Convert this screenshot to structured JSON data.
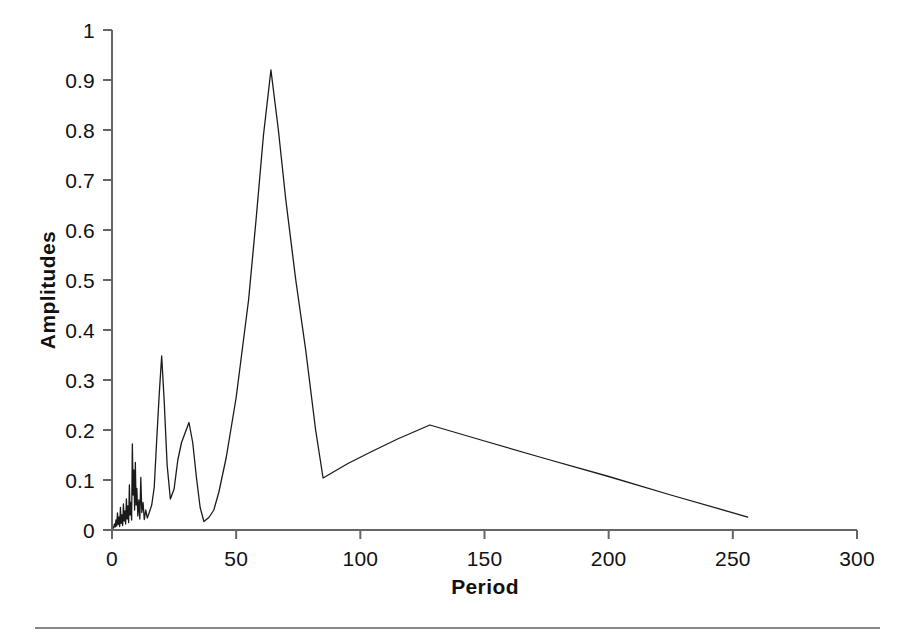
{
  "chart_data": {
    "type": "line",
    "title": "",
    "subtitle": "",
    "xlabel": "Period",
    "ylabel": "Amplitudes",
    "xlim": [
      0,
      300
    ],
    "ylim": [
      0,
      1
    ],
    "xticks": [
      0,
      50,
      100,
      150,
      200,
      250,
      300
    ],
    "xtick_labels": [
      "0",
      "50",
      "100",
      "150",
      "200",
      "250",
      "300"
    ],
    "yticks": [
      0,
      0.1,
      0.2,
      0.3,
      0.4,
      0.5,
      0.6,
      0.7,
      0.8,
      0.9,
      1
    ],
    "ytick_labels": [
      "0",
      "0.1",
      "0.2",
      "0.3",
      "0.4",
      "0.5",
      "0.6",
      "0.7",
      "0.8",
      "0.9",
      "1"
    ],
    "grid": false,
    "legend": false,
    "legend_position": "none",
    "line_color": "#1a1a1a",
    "line_width": 1.3,
    "series": [
      {
        "name": "Amplitudes",
        "x": [
          0.6,
          1.0,
          1.3,
          1.6,
          1.9,
          2.2,
          2.5,
          2.8,
          3.1,
          3.4,
          3.7,
          4.0,
          4.3,
          4.6,
          4.9,
          5.2,
          5.5,
          5.8,
          6.1,
          6.4,
          6.7,
          7.0,
          7.3,
          7.6,
          7.9,
          8.2,
          8.5,
          8.8,
          9.1,
          9.4,
          9.7,
          10.0,
          10.4,
          10.8,
          11.2,
          11.6,
          12.0,
          12.5,
          13.0,
          13.6,
          14.2,
          15.0,
          16.0,
          17.0,
          18.0,
          19.0,
          20.0,
          21.0,
          22.2,
          23.5,
          25.0,
          26.5,
          28.0,
          29.5,
          31.0,
          32.5,
          34.0,
          35.5,
          37.0,
          39.0,
          41.0,
          43.0,
          46.0,
          50.0,
          55.0,
          58.0,
          61.0,
          64.0,
          67.0,
          70.0,
          74.0,
          78.0,
          82.0,
          85.0,
          95.0,
          105.0,
          115.0,
          128.0,
          150.0,
          175.0,
          200.0,
          225.0,
          256.0
        ],
        "y": [
          0.004,
          0.012,
          0.006,
          0.02,
          0.008,
          0.034,
          0.011,
          0.026,
          0.007,
          0.045,
          0.013,
          0.03,
          0.009,
          0.052,
          0.018,
          0.038,
          0.012,
          0.062,
          0.022,
          0.048,
          0.015,
          0.09,
          0.03,
          0.055,
          0.02,
          0.172,
          0.07,
          0.12,
          0.04,
          0.135,
          0.05,
          0.083,
          0.028,
          0.06,
          0.022,
          0.105,
          0.035,
          0.055,
          0.021,
          0.04,
          0.024,
          0.035,
          0.05,
          0.085,
          0.18,
          0.27,
          0.348,
          0.26,
          0.13,
          0.062,
          0.082,
          0.14,
          0.175,
          0.195,
          0.215,
          0.175,
          0.105,
          0.045,
          0.017,
          0.025,
          0.04,
          0.075,
          0.145,
          0.265,
          0.46,
          0.62,
          0.79,
          0.92,
          0.8,
          0.66,
          0.5,
          0.36,
          0.2,
          0.104,
          0.133,
          0.158,
          0.182,
          0.21,
          0.178,
          0.142,
          0.107,
          0.07,
          0.026
        ]
      }
    ],
    "annotations": [
      {
        "label": "noise band",
        "period_range": [
          0,
          14
        ],
        "max_amplitude": 0.172
      },
      {
        "label": "secondary peak",
        "period": 20,
        "amplitude": 0.348
      },
      {
        "label": "tertiary peak",
        "period": 31,
        "amplitude": 0.215
      },
      {
        "label": "dominant peak",
        "period": 64,
        "amplitude": 0.92
      },
      {
        "label": "local minimum",
        "period": 85,
        "amplitude": 0.104
      },
      {
        "label": "broad peak",
        "period": 128,
        "amplitude": 0.21
      },
      {
        "label": "series end",
        "period": 256,
        "amplitude": 0.026
      }
    ]
  },
  "axes": {
    "x_title": "Period",
    "y_title": "Amplitudes"
  }
}
